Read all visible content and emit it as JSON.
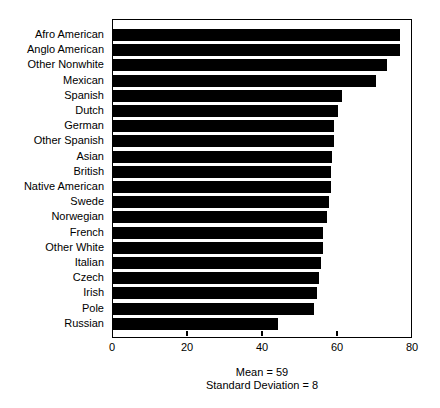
{
  "chart_data": {
    "type": "bar",
    "orientation": "horizontal",
    "title": "",
    "xlabel": "",
    "ylabel": "",
    "xlim": [
      0,
      80
    ],
    "xticks": [
      0,
      20,
      40,
      60,
      80
    ],
    "xtick_labels": [
      "0",
      "20",
      "40",
      "60",
      "80"
    ],
    "grid": false,
    "legend": null,
    "bar_color": "#000000",
    "categories": [
      "Afro American",
      "Anglo American",
      "Other Nonwhite",
      "Mexican",
      "Spanish",
      "Dutch",
      "German",
      "Other Spanish",
      "Asian",
      "British",
      "Native American",
      "Swede",
      "Norwegian",
      "French",
      "Other White",
      "Italian",
      "Czech",
      "Irish",
      "Pole",
      "Russian"
    ],
    "values": [
      76.5,
      76.5,
      73,
      70,
      61,
      60,
      59,
      59,
      58.5,
      58,
      58,
      57.5,
      57,
      56,
      56,
      55.5,
      55,
      54.5,
      53.5,
      44
    ],
    "annotations": [
      "Mean = 59",
      "Standard Deviation = 8"
    ]
  },
  "footnotes": {
    "mean": "Mean = 59",
    "std": "Standard Deviation = 8"
  }
}
